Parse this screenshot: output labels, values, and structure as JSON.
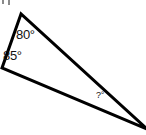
{
  "figure": {
    "title": "",
    "type": "geometry-triangle-angle-problem",
    "background_color": "#ffffff",
    "stroke_color": "#000000",
    "stroke_width": 3,
    "text_color": "#111111",
    "width": 146,
    "height": 135
  },
  "triangle": {
    "name": "scalene-triangle",
    "vertices": [
      {
        "name": "top-apex",
        "x": 21,
        "y": 14
      },
      {
        "name": "left-vertex",
        "x": 2,
        "y": 68
      },
      {
        "name": "right-vertex",
        "x": 147,
        "y": 129
      }
    ],
    "points_attr": "21,14 2,68 147,129"
  },
  "labels": {
    "top_angle": "80°",
    "left_angle": "85°",
    "right_angle": "?°"
  },
  "partial_marks": {
    "mark_one": "",
    "mark_two": ""
  }
}
